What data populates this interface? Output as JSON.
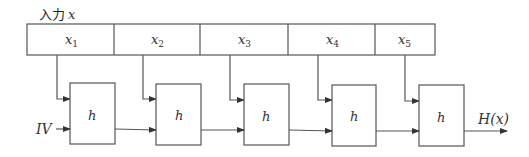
{
  "diagram": {
    "input_label_jp": "入力",
    "input_label_var": "x",
    "blocks": [
      {
        "name": "x",
        "sub": "1"
      },
      {
        "name": "x",
        "sub": "2"
      },
      {
        "name": "x",
        "sub": "3"
      },
      {
        "name": "x",
        "sub": "4"
      },
      {
        "name": "x",
        "sub": "5"
      }
    ],
    "function_boxes": [
      "h",
      "h",
      "h",
      "h",
      "h"
    ],
    "iv_label": "IV",
    "output_label": "H(x)"
  }
}
